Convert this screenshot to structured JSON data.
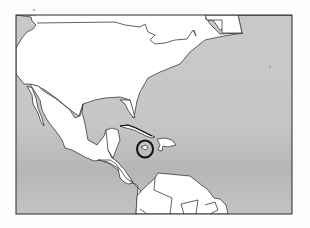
{
  "map": {
    "title": "Map of North America, Central America and the Caribbean",
    "region": "North America / Caribbean",
    "style": "black-and-white outline map",
    "highlighted_feature": "Jamaica",
    "highlight_marker": "circle",
    "frame": {
      "x": 16,
      "y": 15,
      "width": 276,
      "height": 199
    },
    "colors": {
      "water": "#c4c4c4",
      "water_dark_band": "#b8b8b8",
      "land": "#ffffff",
      "border": "#3a3a3a",
      "frame": "#2a2a2a",
      "highlight_circle": "#111111",
      "page_background": "#fdfdfd"
    },
    "landmasses": [
      {
        "name": "North America (USA/Canada)"
      },
      {
        "name": "Mexico"
      },
      {
        "name": "Central America"
      },
      {
        "name": "Cuba"
      },
      {
        "name": "Hispaniola"
      },
      {
        "name": "Jamaica"
      },
      {
        "name": "South America (northern coast)"
      },
      {
        "name": "Greenland/Newfoundland fragment"
      }
    ]
  }
}
